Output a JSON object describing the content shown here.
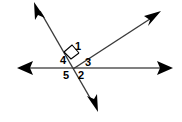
{
  "figure": {
    "type": "geometry-diagram",
    "width": 182,
    "height": 122,
    "background_color": "#ffffff",
    "line_color": "#808080",
    "ray_color": "#3a3a3a",
    "arrow_color": "#000000",
    "label_color": "#000000"
  },
  "labels": [
    {
      "id": "label-1",
      "text": "1",
      "x": 72,
      "y": 41
    },
    {
      "id": "label-4",
      "text": "4",
      "x": 57,
      "y": 55
    },
    {
      "id": "label-3",
      "text": "3",
      "x": 82,
      "y": 57
    },
    {
      "id": "label-5",
      "text": "5",
      "x": 60,
      "y": 70
    },
    {
      "id": "label-2",
      "text": "2",
      "x": 75,
      "y": 70
    }
  ],
  "marks": {
    "right_angle": {
      "name": "right-angle-square",
      "present": true
    }
  },
  "lines": [
    {
      "name": "horizontal-line",
      "from": [
        18,
        68
      ],
      "to": [
        172,
        68
      ],
      "arrow_start": true,
      "arrow_end": true,
      "color": "#808080"
    },
    {
      "name": "transversal-line",
      "from": [
        36,
        3
      ],
      "to": [
        97,
        110
      ],
      "arrow_start": true,
      "arrow_end": true,
      "color": "#3a3a3a"
    },
    {
      "name": "upper-right-ray",
      "from": [
        73,
        69
      ],
      "to": [
        160,
        12
      ],
      "arrow_start": false,
      "arrow_end": true,
      "color": "#3a3a3a"
    }
  ]
}
